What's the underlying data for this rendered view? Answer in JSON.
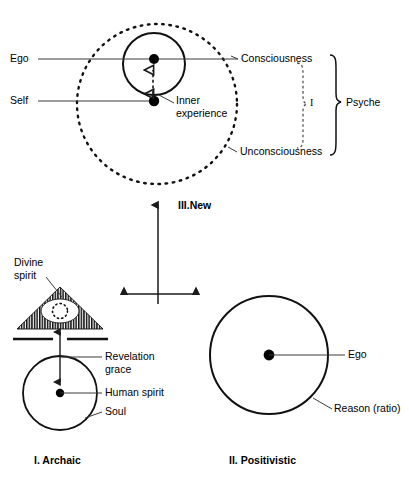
{
  "figure": {
    "title_visible": false,
    "panels": [
      {
        "id": "archaic",
        "caption": "I. Archaic",
        "labels": {
          "divine_spirit": "Divine\nspirit",
          "divine_spirit_line1": "Divine",
          "divine_spirit_line2": "spirit",
          "revelation_line1": "Revelation",
          "revelation_line2": "grace",
          "human_spirit": "Human spirit",
          "soul": "Soul"
        }
      },
      {
        "id": "positivistic",
        "caption": "II. Positivistic",
        "labels": {
          "ego": "Ego",
          "reason": "Reason (ratio)"
        }
      },
      {
        "id": "new",
        "caption": "III.New",
        "labels": {
          "ego": "Ego",
          "self": "Self",
          "inner_experience_line1": "Inner",
          "inner_experience_line2": "experience",
          "consciousness": "Consciousness",
          "unconsciousness": "Unconsciousness",
          "bracket_inner": "I",
          "bracket_outer": "Psyche"
        }
      }
    ]
  },
  "colors": {
    "ink": "#000000",
    "line": "#1a1a1a",
    "leader": "#3a3a3a",
    "background": "#ffffff"
  },
  "icons": {
    "arrow_up": "arrow-up-icon",
    "arrow_double": "arrow-double-headed-icon",
    "dotted_circle": "dotted-circle-icon"
  }
}
